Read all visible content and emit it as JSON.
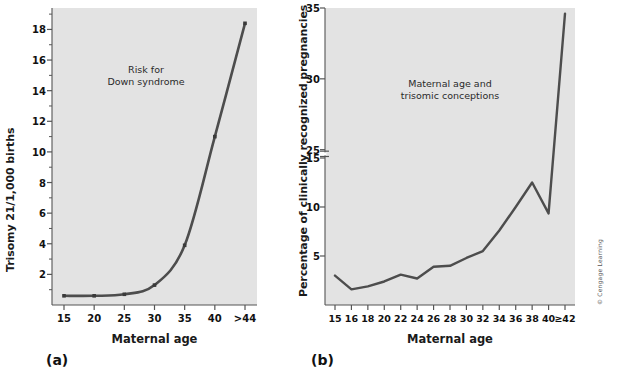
{
  "figure": {
    "background": "#ffffff",
    "plot_background": "#e3e3e3",
    "line_color": "#4d4d4d",
    "axis_color": "#555555",
    "text_color": "#111111"
  },
  "panels": [
    {
      "letter": "(a)",
      "annotation_line1": "Risk for",
      "annotation_line2": "Down syndrome"
    },
    {
      "letter": "(b)",
      "annotation_line1": "Maternal age and",
      "annotation_line2": "trisomic conceptions"
    }
  ],
  "credit": "© Cengage Learning",
  "chart_data": [
    {
      "type": "line",
      "id": "panel-a",
      "title": "Risk for Down syndrome",
      "xlabel": "Maternal age",
      "ylabel": "Trisomy 21/1,000 births",
      "categories": [
        "15",
        "20",
        "25",
        "30",
        "35",
        "40",
        ">44"
      ],
      "values": [
        0.6,
        0.6,
        0.7,
        1.3,
        3.9,
        11.0,
        18.4
      ],
      "ytick_labels": [
        "2",
        "4",
        "6",
        "8",
        "10",
        "12",
        "14",
        "16",
        "18"
      ],
      "ytick_values": [
        2,
        4,
        6,
        8,
        10,
        12,
        14,
        16,
        18
      ],
      "yminor_values": [
        1,
        3,
        5,
        7,
        9,
        11,
        13,
        15,
        17,
        19
      ],
      "ylim": [
        0,
        19.4
      ],
      "grid": false,
      "legend": "none",
      "markers": true,
      "axis_break": false
    },
    {
      "type": "line",
      "id": "panel-b",
      "title": "Maternal age and trisomic conceptions",
      "xlabel": "Maternal age",
      "ylabel": "Percentage of clinically recognized pregnancies",
      "categories": [
        "15",
        "16",
        "18",
        "20",
        "22",
        "24",
        "26",
        "28",
        "30",
        "32",
        "34",
        "36",
        "38",
        "40",
        "≥42"
      ],
      "values": [
        3.0,
        1.6,
        1.9,
        2.4,
        3.1,
        2.7,
        3.9,
        4.0,
        4.8,
        5.5,
        7.6,
        10.0,
        12.5,
        20.5,
        34.6
      ],
      "ytick_labels": [
        "5",
        "10",
        "15",
        "25",
        "30",
        "35"
      ],
      "ytick_values": [
        5,
        10,
        15,
        25,
        30,
        35
      ],
      "ylim": [
        0,
        35
      ],
      "axis_break": true,
      "axis_break_between": [
        15,
        25
      ],
      "grid": false,
      "legend": "none",
      "markers": false
    }
  ]
}
